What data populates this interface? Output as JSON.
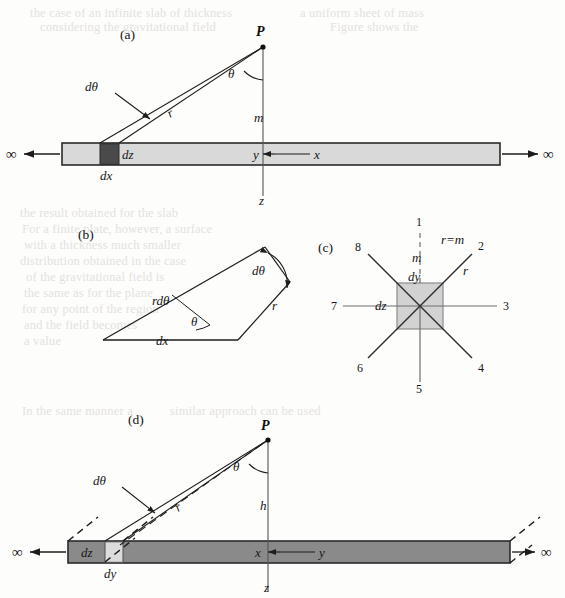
{
  "figure": {
    "caption_panels": [
      "(a)",
      "(b)",
      "(c)",
      "(d)"
    ],
    "infinity_symbol": "∞"
  },
  "panel_a": {
    "tag": "(a)",
    "point_P": "P",
    "angle_theta": "θ",
    "d_theta": "dθ",
    "r": "r",
    "m": "m",
    "dz": "dz",
    "dx": "dx",
    "axis_y": "y",
    "axis_x": "x",
    "axis_z": "z",
    "left_infinity": "∞",
    "right_infinity": "∞",
    "slab_color": "#d9d9d9",
    "element_color": "#4a4a4a"
  },
  "panel_b": {
    "tag": "(b)",
    "d_theta": "dθ",
    "r_d_theta": "rdθ",
    "r": "r",
    "theta": "θ",
    "dx": "dx"
  },
  "panel_c": {
    "tag": "(c)",
    "r_equals_m": "r=m",
    "m": "m",
    "dy": "dy",
    "dz": "dz",
    "r": "r",
    "ray_labels": [
      "1",
      "2",
      "3",
      "4",
      "5",
      "6",
      "7",
      "8"
    ],
    "square_color": "#d2d2d2"
  },
  "panel_d": {
    "tag": "(d)",
    "point_P": "P",
    "angle_theta": "θ",
    "d_theta": "dθ",
    "r": "r",
    "h": "h",
    "dz": "dz",
    "dy": "dy",
    "axis_x": "x",
    "axis_y": "y",
    "axis_z": "z",
    "left_infinity": "∞",
    "right_infinity": "∞",
    "slab_color": "#8a8a8a",
    "element_color": "#dcdcdc"
  },
  "background_bleed": [
    {
      "text": "the case of an infinite slab of thickness",
      "x": 30,
      "y": 6
    },
    {
      "text": "a uniform sheet of mass",
      "x": 300,
      "y": 6
    },
    {
      "text": "considering the gravitational field",
      "x": 40,
      "y": 20
    },
    {
      "text": "Figure shows the",
      "x": 330,
      "y": 20
    },
    {
      "text": "the result obtained for the slab",
      "x": 20,
      "y": 206
    },
    {
      "text": "For a finite plate, however, a surface",
      "x": 22,
      "y": 222
    },
    {
      "text": "with a thickness much smaller",
      "x": 24,
      "y": 238
    },
    {
      "text": "distribution obtained in the case",
      "x": 20,
      "y": 254
    },
    {
      "text": "of the gravitational field is",
      "x": 26,
      "y": 270
    },
    {
      "text": "the same as for the plane",
      "x": 24,
      "y": 286
    },
    {
      "text": "for any point of the region",
      "x": 22,
      "y": 302
    },
    {
      "text": "and the field becomes",
      "x": 24,
      "y": 318
    },
    {
      "text": "a value",
      "x": 24,
      "y": 334
    },
    {
      "text": "In the same manner a",
      "x": 22,
      "y": 404
    },
    {
      "text": "similar approach can be used",
      "x": 170,
      "y": 404
    }
  ]
}
